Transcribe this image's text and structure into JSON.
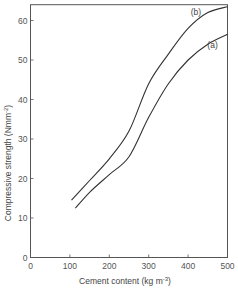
{
  "chart_data": {
    "type": "line",
    "title": "",
    "xlabel": "Cement content  (kg m",
    "xlabel_sup": "-3",
    "xlabel_close": ")",
    "ylabel": "Compressive strength (Nmm",
    "ylabel_sup": "-2",
    "ylabel_close": ")",
    "xlim": [
      0,
      500
    ],
    "ylim": [
      0,
      64
    ],
    "xticks": [
      0,
      100,
      200,
      300,
      400,
      500
    ],
    "yticks": [
      0,
      10,
      20,
      30,
      40,
      50,
      60
    ],
    "grid": false,
    "legend": "inline labels",
    "series": [
      {
        "name": "(b)",
        "x": [
          104,
          150,
          200,
          250,
          300,
          350,
          400,
          450,
          500
        ],
        "y": [
          14.5,
          19.5,
          25,
          32,
          44,
          51.5,
          58,
          62,
          63.5
        ],
        "label_pos": [
          420,
          61.5
        ]
      },
      {
        "name": "(a)",
        "x": [
          114,
          150,
          200,
          250,
          300,
          350,
          400,
          450,
          500
        ],
        "y": [
          12.5,
          16.5,
          21,
          25.5,
          35.5,
          44,
          50,
          54,
          56.5
        ],
        "label_pos": [
          462,
          53
        ]
      }
    ]
  }
}
